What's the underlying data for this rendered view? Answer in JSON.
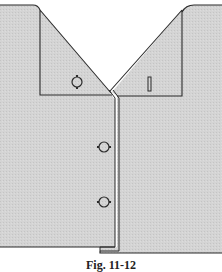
{
  "figure": {
    "colors": {
      "fabric": "#d2d2d2",
      "outline": "#2b2b2b",
      "background": "#ffffff"
    },
    "elements": {
      "left_front": "left front panel with button stand",
      "right_front": "right front panel with buttonholes",
      "left_collar": "left collar point with button",
      "right_collar": "right collar point with buttonhole",
      "placket": "front placket seam (double line)",
      "buttons": [
        "collar button",
        "front button 1",
        "front button 2"
      ],
      "buttonholes": [
        "collar buttonhole"
      ]
    }
  },
  "caption": "Fig. 11-12"
}
